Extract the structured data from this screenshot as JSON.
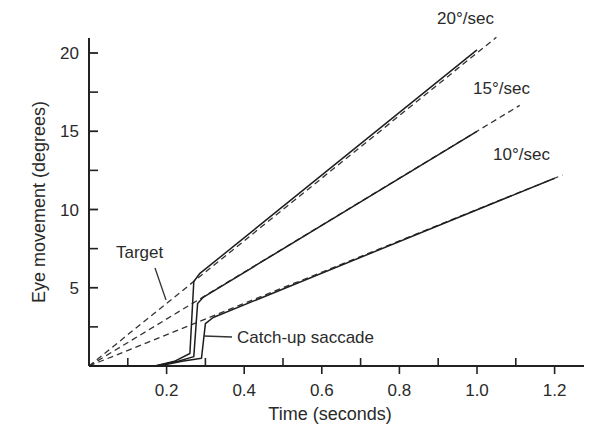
{
  "chart_data": {
    "type": "line",
    "title": "",
    "xlabel": "Time (seconds)",
    "ylabel": "Eye movement (degrees)",
    "xlim": [
      0,
      1.25
    ],
    "ylim": [
      0,
      21
    ],
    "x_ticks_major": [
      0.2,
      0.4,
      0.6,
      0.8,
      1.0,
      1.2
    ],
    "x_ticks_minor": [
      0.1,
      0.3,
      0.5,
      0.7,
      0.9,
      1.1
    ],
    "y_ticks_major": [
      5,
      10,
      15,
      20
    ],
    "y_ticks_minor": [
      2.5,
      7.5,
      12.5,
      17.5
    ],
    "grid": false,
    "legend": null,
    "series": [
      {
        "name": "Target 20°/sec",
        "style": "dashed",
        "x": [
          0.0,
          1.05
        ],
        "y": [
          0.0,
          21.0
        ]
      },
      {
        "name": "Target 15°/sec",
        "style": "dashed",
        "x": [
          0.0,
          1.11
        ],
        "y": [
          0.0,
          16.65
        ]
      },
      {
        "name": "Target 10°/sec",
        "style": "dashed",
        "x": [
          0.0,
          1.22
        ],
        "y": [
          0.0,
          12.2
        ]
      },
      {
        "name": "Eye 20°/sec",
        "style": "solid",
        "x": [
          0.0,
          0.17,
          0.22,
          0.26,
          0.27,
          0.285,
          1.0
        ],
        "y": [
          0.0,
          0.0,
          0.3,
          0.8,
          5.4,
          5.9,
          20.2
        ]
      },
      {
        "name": "Eye 15°/sec",
        "style": "solid",
        "x": [
          0.0,
          0.17,
          0.23,
          0.27,
          0.28,
          0.295,
          1.0
        ],
        "y": [
          0.0,
          0.0,
          0.3,
          0.6,
          4.0,
          4.4,
          15.0
        ]
      },
      {
        "name": "Eye 10°/sec",
        "style": "solid",
        "x": [
          0.0,
          0.18,
          0.24,
          0.29,
          0.3,
          0.32,
          1.2
        ],
        "y": [
          0.0,
          0.0,
          0.3,
          0.5,
          2.7,
          3.1,
          12.0
        ]
      }
    ],
    "annotations": [
      {
        "text": "20°/sec",
        "x": 0.97,
        "y": 21.8
      },
      {
        "text": "15°/sec",
        "x": 1.02,
        "y": 17.5
      },
      {
        "text": "10°/sec",
        "x": 1.03,
        "y": 13.5
      },
      {
        "text": "Target",
        "x": 0.07,
        "y": 7.3,
        "points_to": "dashed target lines"
      },
      {
        "text": "Catch-up saccade",
        "x": 0.34,
        "y": 2.0,
        "points_to": "saccade of 10°/sec eye trace"
      }
    ]
  },
  "labels": {
    "xlabel": "Time (seconds)",
    "ylabel": "Eye movement (degrees)",
    "x_ticks": [
      "0.2",
      "0.4",
      "0.6",
      "0.8",
      "1.0",
      "1.2"
    ],
    "y_ticks": [
      "5",
      "10",
      "15",
      "20"
    ],
    "speed_20": "20°/sec",
    "speed_15": "15°/sec",
    "speed_10": "10°/sec",
    "target": "Target",
    "saccade": "Catch-up saccade"
  }
}
